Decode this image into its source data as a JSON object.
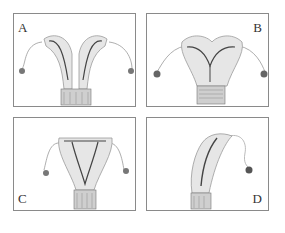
{
  "figure": {
    "type": "anatomical-illustration",
    "panels": [
      {
        "id": "A",
        "label": "A",
        "label_position": "top-left",
        "description": "septate/bicornuate uterus with deep midline division into two horns, tubes and ovaries bilaterally, cervix below"
      },
      {
        "id": "B",
        "label": "B",
        "label_position": "top-right",
        "description": "arcuate/heart-shaped uterus with shallow fundal indentation, Y-shaped cavity, bilateral tubes and ovaries"
      },
      {
        "id": "C",
        "label": "C",
        "label_position": "bottom-left",
        "description": "normal T-shaped/triangular uterine cavity with bilateral tubes and ovaries"
      },
      {
        "id": "D",
        "label": "D",
        "label_position": "bottom-right",
        "description": "unicornuate uterus curving to one side with single tube and ovary"
      }
    ],
    "colors": {
      "border": "#8a8a8a",
      "ink": "#333333",
      "tissue": "#9a9a9a",
      "background": "#ffffff"
    }
  }
}
